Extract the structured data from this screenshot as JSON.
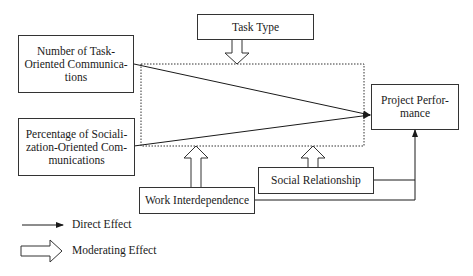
{
  "diagram": {
    "nodes": {
      "task_type": "Task Type",
      "task_oriented": "Number of Task-Oriented Communica-tions",
      "socialization_oriented": "Percentage of Sociali-zation-Oriented Com-munications",
      "project_performance": "Project Perfor-mance",
      "work_interdependence": "Work Interdependence",
      "social_relationship": "Social Relationship"
    },
    "lines": {
      "task_oriented": [
        "Number of Task-",
        "Oriented Communica-",
        "tions"
      ],
      "socialization_oriented": [
        "Percentage of Sociali-",
        "zation-Oriented Com-",
        "munications"
      ],
      "project_performance": [
        "Project Perfor-",
        "mance"
      ]
    },
    "edges": [
      {
        "from": "Number of Task-Oriented Communications",
        "to": "Project Performance",
        "type": "direct"
      },
      {
        "from": "Percentage of Socialization-Oriented Communications",
        "to": "Project Performance",
        "type": "direct"
      },
      {
        "from": "Work Interdependence",
        "to": "Project Performance",
        "type": "direct"
      },
      {
        "from": "Social Relationship",
        "to": "Project Performance",
        "type": "direct"
      },
      {
        "from": "Task Type",
        "to": "moderated relationships",
        "type": "moderating"
      },
      {
        "from": "Work Interdependence",
        "to": "moderated relationships",
        "type": "moderating"
      },
      {
        "from": "Social Relationship",
        "to": "moderated relationships",
        "type": "moderating"
      }
    ],
    "legend": {
      "direct": "Direct Effect",
      "moderating": "Moderating Effect"
    }
  }
}
